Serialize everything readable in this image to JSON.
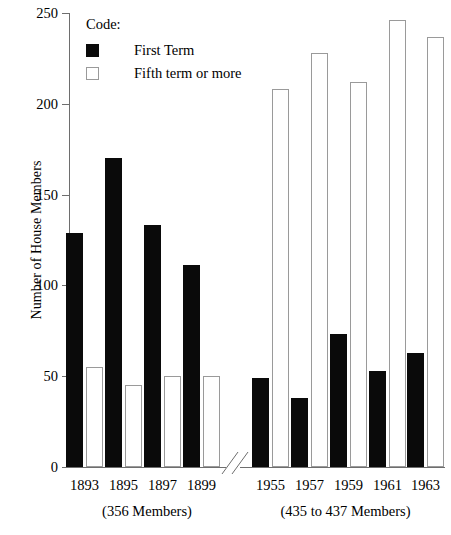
{
  "chart_data": {
    "type": "bar",
    "title": "",
    "subtitle": "",
    "xlabel": "",
    "ylabel": "Number of House Members",
    "ylim": [
      0,
      250
    ],
    "ytick_values": [
      0,
      50,
      100,
      150,
      200,
      250
    ],
    "ytick_labels": [
      "0",
      "50",
      "100",
      "150",
      "200",
      "250"
    ],
    "grid": false,
    "legend_position": "top-left",
    "legend_title": "Code:",
    "axis_break": true,
    "categories": [
      "1893",
      "1895",
      "1897",
      "1899",
      "1955",
      "1957",
      "1959",
      "1961",
      "1963"
    ],
    "series": [
      {
        "name": "First Term",
        "color": "#0a0a0a",
        "style": "filled",
        "values": [
          129,
          170,
          133,
          111,
          49,
          38,
          73,
          53,
          63
        ]
      },
      {
        "name": "Fifth term or more",
        "color": "#ffffff",
        "style": "outlined",
        "values": [
          55,
          45,
          50,
          50,
          208,
          228,
          212,
          246,
          237
        ]
      }
    ],
    "groups": [
      {
        "label": "(356 Members)",
        "categories": [
          "1893",
          "1895",
          "1897",
          "1899"
        ]
      },
      {
        "label": "(435 to 437 Members)",
        "categories": [
          "1955",
          "1957",
          "1959",
          "1961",
          "1963"
        ]
      }
    ],
    "annotations": []
  },
  "axis": {
    "y_title": "Number of House Members",
    "y_ticks": [
      "250",
      "200",
      "150",
      "100",
      "50",
      "0"
    ],
    "x_labels": [
      "1893",
      "1895",
      "1897",
      "1899",
      "1955",
      "1957",
      "1959",
      "1961",
      "1963"
    ],
    "group_note_left": "(356 Members)",
    "group_note_right": "(435 to 437 Members)"
  },
  "legend": {
    "title": "Code:",
    "items": [
      {
        "label": "First Term"
      },
      {
        "label": "Fifth term or more"
      }
    ]
  },
  "colors": {
    "first_term": "#0a0a0a",
    "fifth_term_fill": "#ffffff",
    "fifth_term_stroke": "#9a9a9a",
    "axis": "#6e6e6e",
    "text": "#000000",
    "background": "#ffffff"
  }
}
